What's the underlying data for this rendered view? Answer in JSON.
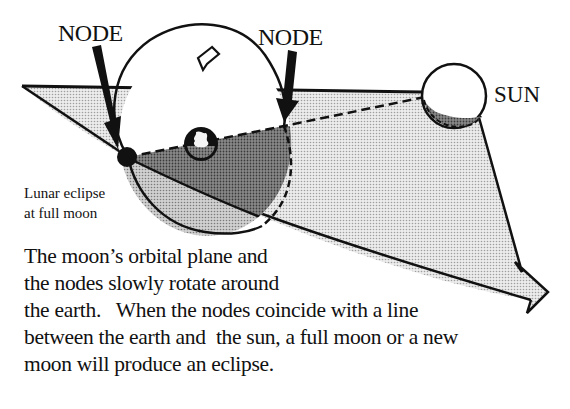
{
  "diagram": {
    "labels": {
      "node_left": "NODE",
      "node_right": "NODE",
      "sun": "SUN",
      "eclipse_note": "Lunar eclipse at full moon",
      "eclipse_note_lines": [
        "Lunar eclipse",
        "at full moon"
      ]
    },
    "caption_lines": [
      "The moon’s orbital plane and",
      "the nodes slowly rotate around",
      "the earth.   When the nodes coincide with a line",
      "between the earth and  the sun, a full moon or a new",
      "moon will produce an eclipse."
    ],
    "elements": {
      "earth": "earth-globe",
      "sun": "sun-circle",
      "moon": "full-moon-at-node",
      "orbit": "lunar-orbit-ellipse",
      "plane": "ecliptic-plane",
      "rotation_arrow": "orbit-direction-arrow",
      "node_line": "earth-sun-dashed-line"
    },
    "colors": {
      "ink": "#111111",
      "plane_fill": "#d9d9d9",
      "shadow_fill": "#9a9a9a",
      "lower_orbit_fill": "#c4c4c4",
      "background": "#ffffff"
    }
  }
}
